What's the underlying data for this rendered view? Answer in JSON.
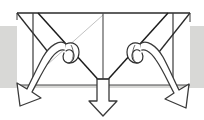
{
  "figure": {
    "title": "Origami fold step diagram",
    "canvas": {
      "width": 204,
      "height": 120
    },
    "colors": {
      "background": "#ffffff",
      "band": "#d8d8d6",
      "stroke_strong": "#1c1c1c",
      "stroke_medium": "#5a5a5a",
      "stroke_light": "#b5b5b5",
      "arrow_outline": "#3a3a3a",
      "arrow_fill": "#ffffff",
      "arrow_shade": "#f2f2f2"
    },
    "band": {
      "label": "horizontal gray background band",
      "x": 0,
      "y": 26,
      "width": 204,
      "height": 62
    },
    "model": {
      "label": "paper model outline",
      "top_edge_y": 13,
      "bottom_edge_y": 85,
      "left_x": 17,
      "right_x": 190,
      "center_x": 103,
      "apex_x": 103,
      "apex_y": 85,
      "left_post_x": 33,
      "right_post_x": 173
    },
    "arrows": [
      {
        "name": "left-fold-arrow",
        "kind": "curved",
        "direction": "down-left",
        "tip_x": 20,
        "tip_y": 106
      },
      {
        "name": "center-fold-arrow",
        "kind": "straight",
        "direction": "down",
        "tip_x": 103,
        "tip_y": 116
      },
      {
        "name": "right-fold-arrow",
        "kind": "curved",
        "direction": "down-right",
        "tip_x": 186,
        "tip_y": 108
      }
    ]
  }
}
